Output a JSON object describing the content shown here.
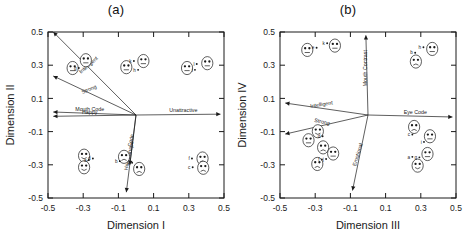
{
  "figure": {
    "panels": [
      {
        "id": "a",
        "title": "(a)",
        "xlabel": "Dimension I",
        "ylabel": "Dimension II",
        "ticks": [
          "-0.5",
          "-0.3",
          "-0.1",
          "0.1",
          "0.3",
          "0.5"
        ],
        "vectors": [
          {
            "name": "Intelligent",
            "label": "Intelligent",
            "x": -0.47,
            "y": 0.5,
            "rot": -41
          },
          {
            "name": "Strong",
            "label": "Strong",
            "x": -0.47,
            "y": 0.235,
            "rot": -23
          },
          {
            "name": "Mouth Code",
            "label": "Mouth Code",
            "x": -0.47,
            "y": 0.018,
            "rot": 0
          },
          {
            "name": "Happy",
            "label": "Happy",
            "x": -0.47,
            "y": -0.008,
            "rot": 0
          },
          {
            "name": "Unattractive",
            "label": "Unattractive",
            "x": 0.48,
            "y": 0.005,
            "rot": 0
          },
          {
            "name": "Head Shape",
            "label": "Head Shape",
            "x": -0.055,
            "y": -0.465,
            "rot": -78
          },
          {
            "name": "Code",
            "label": "Code",
            "x": -0.035,
            "y": -0.3,
            "rot": -78
          }
        ],
        "points": [
          {
            "label": "g",
            "x": -0.325,
            "y": 0.283
          },
          {
            "label": "k",
            "x": -0.012,
            "y": 0.325
          },
          {
            "label": "h",
            "x": 0.012,
            "y": 0.272
          },
          {
            "label": "l",
            "x": 0.345,
            "y": 0.307
          },
          {
            "label": "i",
            "x": 0.335,
            "y": 0.272
          },
          {
            "label": "a",
            "x": -0.268,
            "y": -0.272
          },
          {
            "label": "d",
            "x": -0.245,
            "y": -0.262
          },
          {
            "label": "b",
            "x": -0.092,
            "y": -0.278
          },
          {
            "label": "e",
            "x": -0.022,
            "y": -0.288
          },
          {
            "label": "f",
            "x": 0.318,
            "y": -0.262
          },
          {
            "label": "c",
            "x": 0.322,
            "y": -0.315
          }
        ],
        "faces": [
          {
            "x": -0.36,
            "y": 0.283,
            "expr": "neutral"
          },
          {
            "x": -0.285,
            "y": 0.33,
            "expr": "neutral"
          },
          {
            "x": -0.055,
            "y": 0.288,
            "expr": "neutral"
          },
          {
            "x": 0.042,
            "y": 0.325,
            "expr": "neutral"
          },
          {
            "x": 0.29,
            "y": 0.283,
            "expr": "neutral"
          },
          {
            "x": 0.405,
            "y": 0.312,
            "expr": "neutral"
          },
          {
            "x": -0.295,
            "y": -0.245,
            "expr": "smile"
          },
          {
            "x": -0.295,
            "y": -0.315,
            "expr": "smile"
          },
          {
            "x": -0.068,
            "y": -0.252,
            "expr": "frown"
          },
          {
            "x": 0.018,
            "y": -0.325,
            "expr": "frown"
          },
          {
            "x": 0.378,
            "y": -0.262,
            "expr": "frown"
          },
          {
            "x": 0.382,
            "y": -0.318,
            "expr": "frown"
          }
        ]
      },
      {
        "id": "b",
        "title": "(b)",
        "xlabel": "Dimension III",
        "ylabel": "Dimension IV",
        "ticks": [
          "-0.5",
          "-0.3",
          "-0.1",
          "0.1",
          "0.3",
          "0.5"
        ],
        "vectors": [
          {
            "name": "Intelligent",
            "label": "Intelligent",
            "x": -0.47,
            "y": 0.072,
            "rot": -9
          },
          {
            "name": "Strong",
            "label": "Strong",
            "x": -0.47,
            "y": -0.115,
            "rot": 13
          },
          {
            "name": "Mouth Contrast",
            "label": "Mouth Contrast",
            "x": -0.012,
            "y": 0.48,
            "rot": -90
          },
          {
            "name": "Eye Code",
            "label": "Eye Code",
            "x": 0.48,
            "y": -0.012,
            "rot": 0
          },
          {
            "name": "Emotional",
            "label": "Emotional",
            "x": -0.088,
            "y": -0.455,
            "rot": -73
          }
        ],
        "points": [
          {
            "label": "e",
            "x": -0.292,
            "y": 0.405
          },
          {
            "label": "k",
            "x": -0.232,
            "y": 0.432
          },
          {
            "label": "b",
            "x": 0.268,
            "y": 0.375
          },
          {
            "label": "h",
            "x": 0.315,
            "y": 0.408
          },
          {
            "label": "d",
            "x": -0.258,
            "y": -0.128
          },
          {
            "label": "f",
            "x": -0.262,
            "y": -0.268
          },
          {
            "label": "j",
            "x": -0.238,
            "y": -0.265
          },
          {
            "label": "c",
            "x": 0.252,
            "y": -0.118
          },
          {
            "label": "i",
            "x": 0.318,
            "y": -0.162
          },
          {
            "label": "a",
            "x": 0.252,
            "y": -0.252
          },
          {
            "label": "g",
            "x": 0.292,
            "y": -0.255
          }
        ],
        "faces": [
          {
            "x": -0.345,
            "y": 0.392,
            "expr": "neutral"
          },
          {
            "x": -0.188,
            "y": 0.418,
            "expr": "neutral"
          },
          {
            "x": 0.272,
            "y": 0.322,
            "expr": "frown"
          },
          {
            "x": 0.365,
            "y": 0.398,
            "expr": "neutral"
          },
          {
            "x": -0.285,
            "y": -0.098,
            "expr": "smile"
          },
          {
            "x": -0.338,
            "y": -0.152,
            "expr": "neutral"
          },
          {
            "x": -0.255,
            "y": -0.195,
            "expr": "frown"
          },
          {
            "x": -0.198,
            "y": -0.232,
            "expr": "neutral"
          },
          {
            "x": -0.288,
            "y": -0.295,
            "expr": "frown"
          },
          {
            "x": 0.262,
            "y": -0.072,
            "expr": "frown"
          },
          {
            "x": 0.352,
            "y": -0.128,
            "expr": "neutral"
          },
          {
            "x": 0.338,
            "y": -0.235,
            "expr": "neutral"
          },
          {
            "x": 0.282,
            "y": -0.305,
            "expr": "smile"
          }
        ]
      }
    ]
  }
}
